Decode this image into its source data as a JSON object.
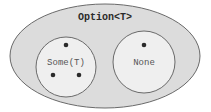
{
  "diagram": {
    "title": "Option<T>",
    "outer_fill": "#dcdcdc",
    "inner_fill": "#efefef",
    "stroke": "#6a6a6a",
    "dot_color": "#2a2a2a",
    "variants": [
      {
        "label": "Some(T)",
        "dots": 3
      },
      {
        "label": "None",
        "dots": 1
      }
    ]
  }
}
